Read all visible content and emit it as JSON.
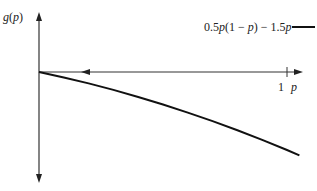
{
  "chart_data": {
    "type": "line",
    "title": "",
    "xlabel": "p",
    "ylabel": "g(p)",
    "x_ticks": [
      "1"
    ],
    "legend": [
      {
        "label": "0.5p(1 − p) − 1.5p",
        "style": "solid",
        "color": "#000000"
      }
    ],
    "series": [
      {
        "name": "0.5p(1 − p) − 1.5p",
        "x": [
          0,
          0.1,
          0.2,
          0.3,
          0.4,
          0.5,
          0.6,
          0.7,
          0.8,
          0.9,
          1.0,
          1.05
        ],
        "y": [
          0,
          -0.105,
          -0.22,
          -0.345,
          -0.48,
          -0.625,
          -0.78,
          -0.945,
          -1.12,
          -1.305,
          -1.5,
          -1.601
        ]
      }
    ],
    "annotations": [
      "left-pointing arrow on p-axis"
    ],
    "grid": false,
    "legend_position": "top-right"
  },
  "labels": {
    "y_axis": "g(p)",
    "x_axis": "p",
    "x_tick_1": "1",
    "legend_text": "0.5p(1 − p) − 1.5p"
  }
}
